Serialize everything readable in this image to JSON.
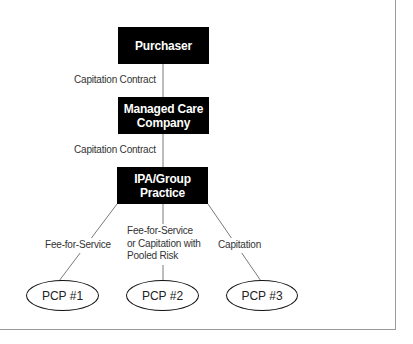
{
  "diagram": {
    "nodes": {
      "purchaser": "Purchaser",
      "managed_care_line1": "Managed Care",
      "managed_care_line2": "Company",
      "ipa_line1": "IPA/Group",
      "ipa_line2": "Practice",
      "pcp1": "PCP #1",
      "pcp2": "PCP #2",
      "pcp3": "PCP #3"
    },
    "edges": {
      "purchaser_to_mco": "Capitation Contract",
      "mco_to_ipa": "Capitation Contract",
      "ipa_to_pcp1": "Fee-for-Service",
      "ipa_to_pcp2_line1": "Fee-for-Service",
      "ipa_to_pcp2_line2": "or Capitation with",
      "ipa_to_pcp2_line3": "Pooled Risk",
      "ipa_to_pcp3": "Capitation"
    },
    "colors": {
      "box_fill": "#000000",
      "box_text": "#ffffff",
      "line": "#7a7a7a",
      "frame": "#9a9a9a"
    }
  }
}
